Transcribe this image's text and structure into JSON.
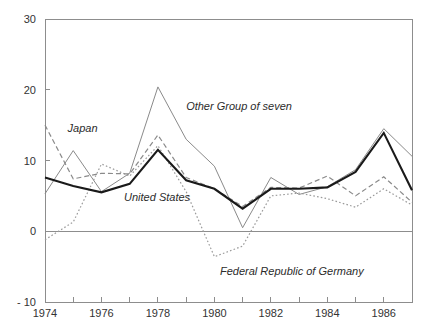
{
  "chart_data": {
    "type": "line",
    "title": "",
    "subtitle": "",
    "xlabel": "",
    "ylabel": "",
    "x": [
      1974,
      1975,
      1976,
      1977,
      1978,
      1979,
      1980,
      1981,
      1982,
      1983,
      1984,
      1985,
      1986,
      1987
    ],
    "xlim": [
      1974,
      1987
    ],
    "ylim": [
      -10,
      30
    ],
    "yticks": [
      -10,
      0,
      10,
      20,
      30
    ],
    "ytick_labels": [
      "- 10",
      "0",
      "10",
      "20",
      "30"
    ],
    "xticks": [
      1974,
      1976,
      1978,
      1980,
      1982,
      1984,
      1986
    ],
    "xtick_labels": [
      "1974",
      "1976",
      "1978",
      "1980",
      "1982",
      "1984",
      "1986"
    ],
    "xminor_ticks": [
      1975,
      1977,
      1979,
      1981,
      1983,
      1985,
      1987
    ],
    "grid": false,
    "legend": "inline-annotations",
    "series": [
      {
        "name": "United States",
        "style": "solid-thick",
        "color": "#1a1a1a",
        "width": 2.1,
        "dash": "none",
        "values": [
          7.6,
          6.4,
          5.5,
          6.7,
          11.5,
          7.2,
          6.0,
          3.2,
          6.0,
          6.0,
          6.2,
          8.4,
          13.9,
          5.8
        ]
      },
      {
        "name": "Other Group of seven",
        "style": "solid-thin",
        "color": "#8a8a8a",
        "width": 1,
        "dash": "none",
        "values": [
          5.3,
          11.4,
          5.6,
          8.2,
          20.4,
          13.0,
          9.2,
          0.5,
          7.6,
          5.2,
          6.3,
          8.7,
          14.5,
          10.6
        ]
      },
      {
        "name": "Japan",
        "style": "dashed",
        "color": "#8a8a8a",
        "width": 1.2,
        "dash": "5,3",
        "values": [
          15.0,
          7.4,
          8.2,
          8.1,
          13.6,
          7.6,
          6.0,
          3.5,
          6.2,
          6.1,
          7.8,
          5.0,
          7.7,
          4.1
        ]
      },
      {
        "name": "Federal Republic of Germany",
        "style": "dotted",
        "color": "#9a9a9a",
        "width": 1.2,
        "dash": "1.6,2.2",
        "values": [
          -1.2,
          1.3,
          9.5,
          7.8,
          12.1,
          5.6,
          -3.6,
          -2.1,
          5.0,
          5.4,
          4.6,
          3.4,
          6.0,
          3.7
        ]
      }
    ],
    "annotations": [
      {
        "text": "Japan",
        "x": 1974.8,
        "y": 14.0,
        "name": "japan-label"
      },
      {
        "text": "Other Group of seven",
        "x": 1979.0,
        "y": 17.2,
        "name": "other-g7-label"
      },
      {
        "text": "United States",
        "x": 1976.8,
        "y": 4.3,
        "name": "united-states-label"
      },
      {
        "text": "Federal Republic of Germany",
        "x": 1980.2,
        "y": -6.2,
        "name": "frg-label"
      }
    ]
  },
  "axes": {
    "y_labels": [
      "30",
      "20",
      "10",
      "0",
      "- 10"
    ],
    "x_labels": [
      "1974",
      "1976",
      "1978",
      "1980",
      "1982",
      "1984",
      "1986"
    ]
  }
}
